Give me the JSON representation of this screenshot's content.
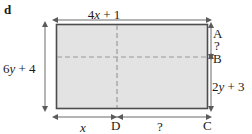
{
  "figure": {
    "part_letter": "d",
    "type": "rectangle-with-dimensions",
    "colors": {
      "fill": "#e3e3e3",
      "border": "#4d4d4d",
      "dashed": "#9a9a9a",
      "dimension_line": "#6b6b6b",
      "text": "#1a1a1a"
    },
    "labels": {
      "top_width": "4x + 1",
      "left_height": "6y + 4",
      "right_lower_height": "2y + 3",
      "right_upper_unknown": "?",
      "bottom_left_segment": "x",
      "bottom_right_segment": "?",
      "vertex_a": "A",
      "vertex_b": "B",
      "vertex_c": "C",
      "vertex_d": "D"
    }
  }
}
